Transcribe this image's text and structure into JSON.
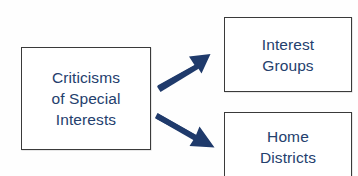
{
  "diagram": {
    "type": "flowchart",
    "orientation": "left-to-right branching",
    "background_color": "#fefefe",
    "text_color": "#24406d",
    "border_color": "#3a3a3a",
    "arrow_color": "#1f3a6b",
    "nodes": [
      {
        "id": "criticisms",
        "label": "Criticisms\nof Special\nInterests",
        "lines": [
          "Criticisms",
          "of Special",
          "Interests"
        ],
        "role": "source"
      },
      {
        "id": "interest_groups",
        "label": "Interest\nGroups",
        "lines": [
          "Interest",
          "Groups"
        ],
        "role": "target"
      },
      {
        "id": "home_districts",
        "label": "Home\nDistricts",
        "lines": [
          "Home",
          "Districts"
        ],
        "role": "target"
      }
    ],
    "edges": [
      {
        "id": "edge-up",
        "from": "criticisms",
        "to": "interest_groups",
        "direction": "up-right",
        "style": "solid-thick-arrow"
      },
      {
        "id": "edge-down",
        "from": "criticisms",
        "to": "home_districts",
        "direction": "down-right",
        "style": "solid-thick-arrow"
      }
    ]
  }
}
